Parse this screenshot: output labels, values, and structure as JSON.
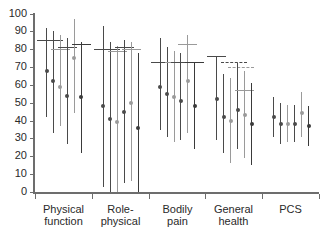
{
  "chart_data": {
    "type": "scatter",
    "title": "",
    "subtitle": "",
    "xlabel": "",
    "ylabel": "",
    "ylim": [
      0,
      100
    ],
    "xlim": [
      0,
      5
    ],
    "grid": false,
    "legend_position": "none",
    "yticks": [
      0,
      10,
      20,
      30,
      40,
      50,
      60,
      70,
      80,
      90,
      100
    ],
    "ytick_labels": [
      "0",
      "10",
      "20",
      "30",
      "40",
      "50",
      "60",
      "70",
      "80",
      "90",
      "100"
    ],
    "categories": [
      "Physical\nfunction",
      "Role-\nphysical",
      "Bodily\npain",
      "General\nhealth",
      "PCS"
    ],
    "category_labels": [
      {
        "line1": "Physical",
        "line2": "function"
      },
      {
        "line1": "Role-",
        "line2": "physical"
      },
      {
        "line1": "Bodily",
        "line2": "pain"
      },
      {
        "line1": "General",
        "line2": "health"
      },
      {
        "line1": "PCS",
        "line2": ""
      }
    ],
    "series": [
      {
        "name": "Series 1",
        "marker": "dark-filled-circle",
        "color": "#3a3a3a"
      },
      {
        "name": "Series 2",
        "marker": "dark-filled-circle",
        "color": "#3a3a3a"
      },
      {
        "name": "Series 3",
        "marker": "light-filled-circle",
        "color": "#9a9a9a"
      },
      {
        "name": "Series 4",
        "marker": "dark-filled-circle",
        "color": "#4a4a4a"
      },
      {
        "name": "Series 5",
        "marker": "light-filled-circle",
        "color": "#9a9a9a"
      },
      {
        "name": "Series 6",
        "marker": "dark-filled-circle",
        "color": "#3a3a3a"
      }
    ],
    "groups": [
      {
        "category": "Physical function",
        "points": [
          {
            "series": "Series 1",
            "value": 68,
            "low": 42,
            "high": 92,
            "cap_high": 85,
            "cap_style": "solid",
            "color": "#4a4a4a"
          },
          {
            "series": "Series 2",
            "value": 62,
            "low": 33,
            "high": 90,
            "cap_high": 85,
            "cap_style": "solid",
            "color": "#4a4a4a"
          },
          {
            "series": "Series 3",
            "value": 59,
            "low": 37,
            "high": 88,
            "cap_high": 80,
            "cap_style": "solid",
            "color": "#9a9a9a"
          },
          {
            "series": "Series 4",
            "value": 54,
            "low": 27,
            "high": 86,
            "cap_high": 81,
            "cap_style": "solid",
            "color": "#4a4a4a"
          },
          {
            "series": "Series 5",
            "value": 75,
            "low": 44,
            "high": 97,
            "cap_high": null,
            "cap_style": "none",
            "color": "#9a9a9a"
          },
          {
            "series": "Series 6",
            "value": 53,
            "low": 22,
            "high": 84,
            "cap_high": 83,
            "cap_style": "solid",
            "color": "#3a3a3a"
          }
        ]
      },
      {
        "category": "Role-physical",
        "points": [
          {
            "series": "Series 1",
            "value": 48,
            "low": 3,
            "high": 93,
            "cap_high": 80,
            "cap_style": "solid",
            "color": "#4a4a4a"
          },
          {
            "series": "Series 2",
            "value": 41,
            "low": 0,
            "high": 84,
            "cap_high": 80,
            "cap_style": "solid",
            "color": "#4a4a4a"
          },
          {
            "series": "Series 3",
            "value": 39,
            "low": 0,
            "high": 82,
            "cap_high": 79,
            "cap_style": "solid",
            "color": "#9a9a9a"
          },
          {
            "series": "Series 4",
            "value": 45,
            "low": 5,
            "high": 85,
            "cap_high": 81,
            "cap_style": "solid",
            "color": "#4a4a4a"
          },
          {
            "series": "Series 5",
            "value": 50,
            "low": 6,
            "high": 84,
            "cap_high": 80,
            "cap_style": "solid",
            "color": "#9a9a9a"
          },
          {
            "series": "Series 6",
            "value": 36,
            "low": 0,
            "high": 78,
            "cap_high": null,
            "cap_style": "none",
            "color": "#3a3a3a"
          }
        ]
      },
      {
        "category": "Bodily pain",
        "points": [
          {
            "series": "Series 1",
            "value": 59,
            "low": 35,
            "high": 86,
            "cap_high": 73,
            "cap_style": "solid",
            "color": "#4a4a4a"
          },
          {
            "series": "Series 2",
            "value": 55,
            "low": 31,
            "high": 81,
            "cap_high": 73,
            "cap_style": "solid",
            "color": "#4a4a4a"
          },
          {
            "series": "Series 3",
            "value": 53,
            "low": 28,
            "high": 79,
            "cap_high": 73,
            "cap_style": "solid",
            "color": "#9a9a9a"
          },
          {
            "series": "Series 4",
            "value": 51,
            "low": 29,
            "high": 78,
            "cap_high": 73,
            "cap_style": "solid",
            "color": "#4a4a4a"
          },
          {
            "series": "Series 5",
            "value": 62,
            "low": 33,
            "high": 88,
            "cap_high": 83,
            "cap_style": "solid",
            "color": "#9a9a9a"
          },
          {
            "series": "Series 6",
            "value": 48,
            "low": 24,
            "high": 73,
            "cap_high": 73,
            "cap_style": "solid",
            "color": "#3a3a3a"
          }
        ]
      },
      {
        "category": "General health",
        "points": [
          {
            "series": "Series 1",
            "value": 52,
            "low": 29,
            "high": 76,
            "cap_high": 76,
            "cap_style": "solid",
            "color": "#4a4a4a"
          },
          {
            "series": "Series 2",
            "value": 42,
            "low": 22,
            "high": 66,
            "cap_high": 73,
            "cap_style": "dashed",
            "color": "#4a4a4a"
          },
          {
            "series": "Series 3",
            "value": 40,
            "low": 16,
            "high": 64,
            "cap_high": 70,
            "cap_style": "dashed",
            "color": "#9a9a9a"
          },
          {
            "series": "Series 4",
            "value": 46,
            "low": 24,
            "high": 72,
            "cap_high": null,
            "cap_style": "none",
            "color": "#4a4a4a"
          },
          {
            "series": "Series 5",
            "value": 43,
            "low": 19,
            "high": 68,
            "cap_high": 57,
            "cap_style": "solid",
            "color": "#9a9a9a"
          },
          {
            "series": "Series 6",
            "value": 38,
            "low": 15,
            "high": 61,
            "cap_high": null,
            "cap_style": "none",
            "color": "#3a3a3a"
          }
        ]
      },
      {
        "category": "PCS",
        "points": [
          {
            "series": "Series 1",
            "value": 42,
            "low": 31,
            "high": 53,
            "cap_high": null,
            "cap_style": "none",
            "color": "#4a4a4a"
          },
          {
            "series": "Series 2",
            "value": 38,
            "low": 27,
            "high": 50,
            "cap_high": null,
            "cap_style": "none",
            "color": "#4a4a4a"
          },
          {
            "series": "Series 3",
            "value": 38,
            "low": 28,
            "high": 49,
            "cap_high": null,
            "cap_style": "none",
            "color": "#9a9a9a"
          },
          {
            "series": "Series 4",
            "value": 38,
            "low": 28,
            "high": 49,
            "cap_high": null,
            "cap_style": "none",
            "color": "#4a4a4a"
          },
          {
            "series": "Series 5",
            "value": 44,
            "low": 31,
            "high": 56,
            "cap_high": null,
            "cap_style": "none",
            "color": "#9a9a9a"
          },
          {
            "series": "Series 6",
            "value": 37,
            "low": 26,
            "high": 48,
            "cap_high": null,
            "cap_style": "none",
            "color": "#3a3a3a"
          }
        ]
      }
    ]
  },
  "axes": {
    "y_axis_name": "y-axis",
    "x_axis_name": "x-axis"
  }
}
